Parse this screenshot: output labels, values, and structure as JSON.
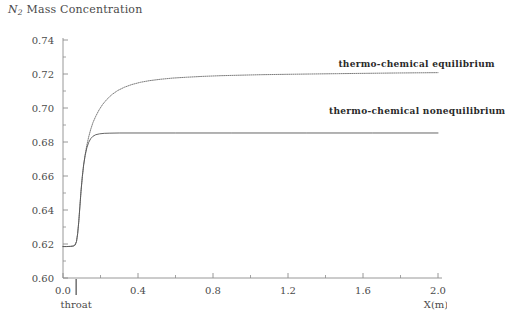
{
  "chart_data": {
    "type": "line",
    "title": "N2 Mass Concentration",
    "title_symbol": "N",
    "title_subscript": "2",
    "title_rest": " Mass Concentration",
    "xlabel": "X(m)",
    "ylabel": "",
    "xlim": [
      0.0,
      2.0
    ],
    "ylim": [
      0.6,
      0.74
    ],
    "xticks": [
      "0.0",
      "0.4",
      "0.8",
      "1.2",
      "1.6",
      "2.0"
    ],
    "xtick_values": [
      0.0,
      0.4,
      0.8,
      1.2,
      1.6,
      2.0
    ],
    "yticks": [
      "0.60",
      "0.62",
      "0.64",
      "0.66",
      "0.68",
      "0.70",
      "0.72",
      "0.74"
    ],
    "ytick_values": [
      0.6,
      0.62,
      0.64,
      0.66,
      0.68,
      0.7,
      0.72,
      0.74
    ],
    "minor_tick_step_y": 0.01,
    "minor_tick_step_x": 0.2,
    "grid": false,
    "legend_position": "inline-right",
    "annotations": [
      {
        "text": "throat",
        "x": 0.07,
        "y": 0.6,
        "type": "axis-marker"
      }
    ],
    "series": [
      {
        "name": "thermo-chemical equilibrium",
        "style": "dotted",
        "color": "#6e6e6e",
        "label_x": 1.49,
        "label_y": 0.7255,
        "points": [
          [
            0.0,
            0.6185
          ],
          [
            0.02,
            0.6185
          ],
          [
            0.04,
            0.6186
          ],
          [
            0.055,
            0.6188
          ],
          [
            0.065,
            0.6195
          ],
          [
            0.072,
            0.6215
          ],
          [
            0.078,
            0.626
          ],
          [
            0.084,
            0.633
          ],
          [
            0.09,
            0.642
          ],
          [
            0.096,
            0.651
          ],
          [
            0.103,
            0.6595
          ],
          [
            0.11,
            0.6665
          ],
          [
            0.118,
            0.6725
          ],
          [
            0.127,
            0.678
          ],
          [
            0.137,
            0.683
          ],
          [
            0.148,
            0.6875
          ],
          [
            0.16,
            0.6915
          ],
          [
            0.175,
            0.6952
          ],
          [
            0.192,
            0.6988
          ],
          [
            0.212,
            0.7022
          ],
          [
            0.235,
            0.7052
          ],
          [
            0.262,
            0.708
          ],
          [
            0.292,
            0.7103
          ],
          [
            0.327,
            0.7122
          ],
          [
            0.367,
            0.7138
          ],
          [
            0.412,
            0.7151
          ],
          [
            0.462,
            0.7161
          ],
          [
            0.52,
            0.7169
          ],
          [
            0.585,
            0.7176
          ],
          [
            0.66,
            0.7181
          ],
          [
            0.745,
            0.7186
          ],
          [
            0.84,
            0.719
          ],
          [
            0.945,
            0.7193
          ],
          [
            1.06,
            0.7196
          ],
          [
            1.185,
            0.7198
          ],
          [
            1.32,
            0.72
          ],
          [
            1.465,
            0.7202
          ],
          [
            1.62,
            0.7204
          ],
          [
            1.785,
            0.7206
          ],
          [
            2.0,
            0.7208
          ]
        ]
      },
      {
        "name": "thermo-chemical nonequilibrium",
        "style": "solid",
        "color": "#555555",
        "label_x": 1.44,
        "label_y": 0.6975,
        "points": [
          [
            0.0,
            0.6185
          ],
          [
            0.02,
            0.6185
          ],
          [
            0.04,
            0.6186
          ],
          [
            0.055,
            0.6188
          ],
          [
            0.065,
            0.6195
          ],
          [
            0.072,
            0.6215
          ],
          [
            0.078,
            0.626
          ],
          [
            0.084,
            0.633
          ],
          [
            0.09,
            0.642
          ],
          [
            0.096,
            0.651
          ],
          [
            0.103,
            0.6595
          ],
          [
            0.11,
            0.6665
          ],
          [
            0.118,
            0.672
          ],
          [
            0.127,
            0.6765
          ],
          [
            0.137,
            0.6798
          ],
          [
            0.148,
            0.682
          ],
          [
            0.16,
            0.6834
          ],
          [
            0.175,
            0.6843
          ],
          [
            0.195,
            0.6848
          ],
          [
            0.22,
            0.6851
          ],
          [
            0.25,
            0.6852
          ],
          [
            0.3,
            0.6853
          ],
          [
            0.4,
            0.6853
          ],
          [
            0.6,
            0.6853
          ],
          [
            0.9,
            0.6853
          ],
          [
            1.3,
            0.6853
          ],
          [
            1.65,
            0.6853
          ],
          [
            2.0,
            0.6853
          ]
        ]
      }
    ]
  }
}
